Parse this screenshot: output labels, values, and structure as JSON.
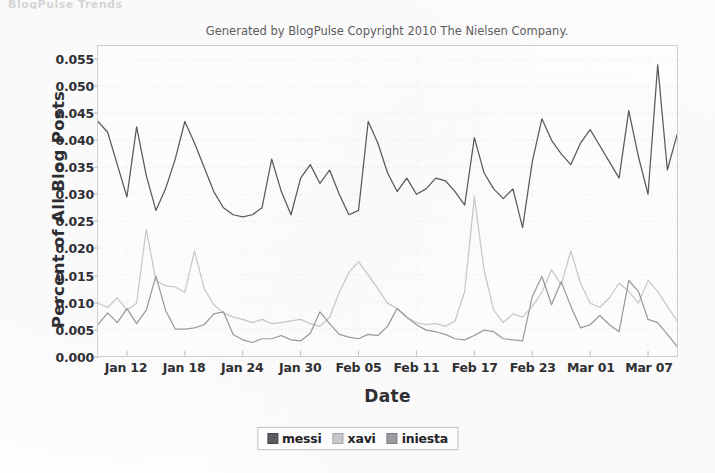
{
  "page": {
    "top_cropped_text": "BlogPulse Trends",
    "subtitle": "Generated by BlogPulse Copyright 2010 The Nielsen Company."
  },
  "legend": {
    "items": [
      {
        "label": "messi",
        "color": "#5a5a60"
      },
      {
        "label": "xavi",
        "color": "#c9c9cf"
      },
      {
        "label": "iniesta",
        "color": "#9b9ba2"
      }
    ]
  },
  "chart_data": {
    "type": "line",
    "title": "",
    "subtitle": "Generated by BlogPulse Copyright 2010 The Nielsen Company.",
    "xlabel": "Date",
    "ylabel": "Percent of All Blog Posts",
    "ylim": [
      0.0,
      0.0575
    ],
    "xlim": [
      "Jan 09",
      "Mar 10"
    ],
    "yticks": [
      0.0,
      0.005,
      0.01,
      0.015,
      0.02,
      0.025,
      0.03,
      0.035,
      0.04,
      0.045,
      0.05,
      0.055
    ],
    "ytick_labels": [
      "0.000",
      "0.005",
      "0.010",
      "0.015",
      "0.020",
      "0.025",
      "0.030",
      "0.035",
      "0.040",
      "0.045",
      "0.050",
      "0.055"
    ],
    "xticks": [
      "Jan 12",
      "Jan 18",
      "Jan 24",
      "Jan 30",
      "Feb 05",
      "Feb 11",
      "Feb 17",
      "Feb 23",
      "Mar 01",
      "Mar 07"
    ],
    "xtick_day_index": [
      3,
      9,
      15,
      21,
      27,
      33,
      39,
      45,
      51,
      57
    ],
    "grid": true,
    "grid_style": "dotted",
    "legend_position": "below",
    "x": [
      "Jan 09",
      "Jan 10",
      "Jan 11",
      "Jan 12",
      "Jan 13",
      "Jan 14",
      "Jan 15",
      "Jan 16",
      "Jan 17",
      "Jan 18",
      "Jan 19",
      "Jan 20",
      "Jan 21",
      "Jan 22",
      "Jan 23",
      "Jan 24",
      "Jan 25",
      "Jan 26",
      "Jan 27",
      "Jan 28",
      "Jan 29",
      "Jan 30",
      "Jan 31",
      "Feb 01",
      "Feb 02",
      "Feb 03",
      "Feb 04",
      "Feb 05",
      "Feb 06",
      "Feb 07",
      "Feb 08",
      "Feb 09",
      "Feb 10",
      "Feb 11",
      "Feb 12",
      "Feb 13",
      "Feb 14",
      "Feb 15",
      "Feb 16",
      "Feb 17",
      "Feb 18",
      "Feb 19",
      "Feb 20",
      "Feb 21",
      "Feb 22",
      "Feb 23",
      "Feb 24",
      "Feb 25",
      "Feb 26",
      "Feb 27",
      "Feb 28",
      "Mar 01",
      "Mar 02",
      "Mar 03",
      "Mar 04",
      "Mar 05",
      "Mar 06",
      "Mar 07",
      "Mar 08",
      "Mar 09",
      "Mar 10"
    ],
    "series": [
      {
        "name": "messi",
        "color": "#5a5a60",
        "values": [
          0.0435,
          0.0415,
          0.0355,
          0.0295,
          0.0425,
          0.0335,
          0.027,
          0.031,
          0.0365,
          0.0435,
          0.0395,
          0.035,
          0.0305,
          0.0275,
          0.0262,
          0.0258,
          0.0262,
          0.0275,
          0.0365,
          0.0305,
          0.0262,
          0.033,
          0.0355,
          0.032,
          0.0345,
          0.03,
          0.0262,
          0.027,
          0.0435,
          0.0395,
          0.034,
          0.0305,
          0.033,
          0.03,
          0.031,
          0.033,
          0.0325,
          0.0305,
          0.028,
          0.0405,
          0.034,
          0.031,
          0.0292,
          0.031,
          0.0238,
          0.036,
          0.044,
          0.04,
          0.0375,
          0.0355,
          0.0395,
          0.042,
          0.039,
          0.036,
          0.033,
          0.0455,
          0.037,
          0.03,
          0.054,
          0.0345,
          0.041
        ]
      },
      {
        "name": "xavi",
        "color": "#c9c9cf",
        "values": [
          0.0098,
          0.009,
          0.0108,
          0.0085,
          0.0098,
          0.0235,
          0.014,
          0.013,
          0.0128,
          0.0118,
          0.0195,
          0.0125,
          0.0095,
          0.008,
          0.0072,
          0.0068,
          0.0062,
          0.0068,
          0.006,
          0.0062,
          0.0065,
          0.0068,
          0.006,
          0.0055,
          0.0072,
          0.0118,
          0.0155,
          0.0175,
          0.015,
          0.0125,
          0.0098,
          0.0088,
          0.0072,
          0.0062,
          0.0058,
          0.006,
          0.0055,
          0.0065,
          0.012,
          0.0295,
          0.016,
          0.0085,
          0.0062,
          0.0078,
          0.0072,
          0.0092,
          0.0118,
          0.016,
          0.0132,
          0.0195,
          0.0135,
          0.0098,
          0.009,
          0.0108,
          0.0135,
          0.012,
          0.0098,
          0.014,
          0.012,
          0.0092,
          0.0065
        ]
      },
      {
        "name": "iniesta",
        "color": "#9b9ba2",
        "values": [
          0.0058,
          0.008,
          0.0062,
          0.0088,
          0.006,
          0.0085,
          0.0148,
          0.0085,
          0.005,
          0.005,
          0.0052,
          0.0058,
          0.0078,
          0.0082,
          0.004,
          0.003,
          0.0025,
          0.0032,
          0.0032,
          0.0038,
          0.003,
          0.0028,
          0.0042,
          0.0082,
          0.006,
          0.004,
          0.0035,
          0.0032,
          0.004,
          0.0038,
          0.0055,
          0.0088,
          0.0072,
          0.0058,
          0.0048,
          0.0045,
          0.004,
          0.0032,
          0.003,
          0.0038,
          0.0048,
          0.0045,
          0.0032,
          0.003,
          0.0028,
          0.011,
          0.0148,
          0.0095,
          0.0138,
          0.0092,
          0.0052,
          0.0058,
          0.0075,
          0.0058,
          0.0045,
          0.014,
          0.012,
          0.0068,
          0.0062,
          0.004,
          0.0018
        ]
      }
    ]
  }
}
